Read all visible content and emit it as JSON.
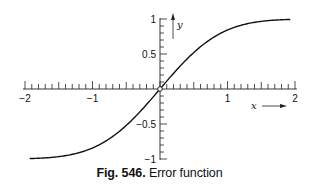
{
  "caption": {
    "figure_label": "Fig. 546.",
    "title": "Error function"
  },
  "chart_data": {
    "type": "line",
    "title": "Error function",
    "figure_label": "Fig. 546.",
    "xlabel": "x",
    "ylabel": "y",
    "xlim": [
      -2,
      2
    ],
    "ylim": [
      -1,
      1
    ],
    "x_ticks": [
      -2,
      -1,
      1,
      2
    ],
    "x_tick_labels": [
      "−2",
      "−1",
      "1",
      "2"
    ],
    "x_minor_tick_step": 0.1,
    "y_ticks": [
      -1,
      -0.5,
      0.5,
      1
    ],
    "y_tick_labels": [
      "−1",
      "−0.5",
      "0.5",
      "1"
    ],
    "y_minor_tick_step": 0.1,
    "grid": false,
    "legend": null,
    "series": [
      {
        "name": "erf(x)",
        "x": [
          -1.93,
          -1.75,
          -1.5,
          -1.25,
          -1.0,
          -0.75,
          -0.5,
          -0.25,
          0,
          0.25,
          0.5,
          0.75,
          1.0,
          1.25,
          1.5,
          1.75,
          1.93
        ],
        "values": [
          -0.994,
          -0.987,
          -0.966,
          -0.923,
          -0.843,
          -0.711,
          -0.52,
          -0.276,
          0,
          0.276,
          0.52,
          0.711,
          0.843,
          0.923,
          0.966,
          0.987,
          0.994
        ]
      }
    ],
    "annotations": [
      "origin marked with small open circle",
      "arrow on y axis labeled y",
      "arrow below x axis labeled x"
    ]
  },
  "layout": {
    "origin_px": [
      160,
      89
    ],
    "x_unit_px": 67.5,
    "y_unit_px": 70,
    "curve_color": "#111111",
    "axis_color": "#222222"
  }
}
